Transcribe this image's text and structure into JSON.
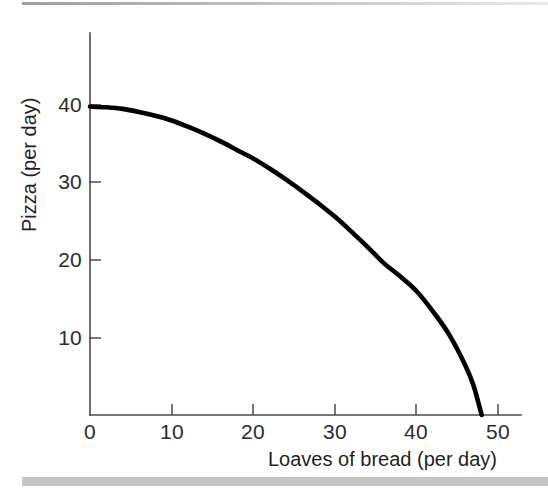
{
  "figure": {
    "kind": "production-possibilities-frontier",
    "background_color": "#ffffff",
    "curve_color": "#000000",
    "axis_color": "#4a4a4a",
    "separator_color": "#c6c6c6"
  },
  "chart_data": {
    "type": "line",
    "title": "",
    "subtitle": "",
    "xlabel": "Loaves of bread (per day)",
    "ylabel": "Pizza (per day)",
    "xlim": [
      0,
      52
    ],
    "ylim": [
      0,
      45
    ],
    "xticks": [
      0,
      10,
      20,
      30,
      40,
      50
    ],
    "yticks": [
      0,
      10,
      20,
      30,
      40
    ],
    "xticklabels": [
      "0",
      "10",
      "20",
      "30",
      "40",
      "50"
    ],
    "yticklabels": [
      "0",
      "10",
      "20",
      "30",
      "40"
    ],
    "grid": false,
    "legend": null,
    "annotations": [],
    "series": [
      {
        "name": "Production possibilities frontier",
        "color": "#000000",
        "linewidth": 4.6,
        "x": [
          0,
          2,
          4,
          6,
          8,
          10,
          12,
          14,
          16,
          18,
          20,
          22,
          24,
          26,
          28,
          30,
          32,
          34,
          36,
          38,
          40,
          42,
          44,
          46,
          47,
          48
        ],
        "y": [
          39.8,
          39.7,
          39.5,
          39.1,
          38.6,
          38.0,
          37.2,
          36.3,
          35.3,
          34.2,
          33.1,
          31.8,
          30.4,
          28.9,
          27.3,
          25.6,
          23.7,
          21.7,
          19.6,
          17.9,
          16.0,
          13.4,
          10.4,
          6.4,
          3.8,
          0.0
        ]
      }
    ],
    "endpoints": {
      "y_intercept": {
        "x": 0,
        "y": 40
      },
      "x_intercept": {
        "x": 48,
        "y": 0
      }
    }
  },
  "axes": {
    "x_title": "Loaves of bread (per day)",
    "y_title": "Pizza (per day)",
    "x_tick_labels": [
      "0",
      "10",
      "20",
      "30",
      "40",
      "50"
    ],
    "y_tick_labels": [
      "10",
      "20",
      "30",
      "40"
    ]
  }
}
